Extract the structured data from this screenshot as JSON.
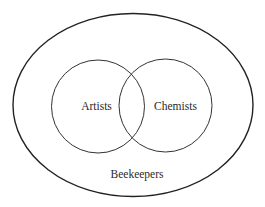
{
  "diagram": {
    "type": "venn",
    "universe": {
      "label": "Beekeepers"
    },
    "sets": [
      {
        "label": "Artists"
      },
      {
        "label": "Chemists"
      }
    ],
    "colors": {
      "stroke": "#222222",
      "background": "#ffffff",
      "text": "#2a2a2a"
    }
  }
}
